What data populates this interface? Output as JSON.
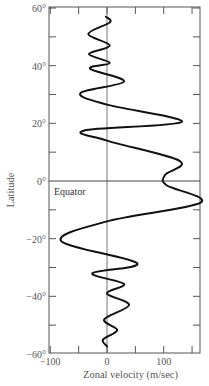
{
  "chart_data": {
    "type": "line",
    "title": "",
    "xlabel": "Zonal velocity (m/sec)",
    "ylabel": "Latitude",
    "xlim": [
      -100,
      165
    ],
    "ylim": [
      -60,
      60
    ],
    "x_ticks": [
      -100,
      -50,
      0,
      50,
      100,
      150
    ],
    "x_tick_labels": [
      "−100",
      "",
      "0",
      "",
      "100",
      ""
    ],
    "y_ticks": [
      60,
      50,
      40,
      30,
      20,
      10,
      0,
      -10,
      -20,
      -30,
      -40,
      -50,
      -60
    ],
    "y_tick_labels": [
      "60°",
      "",
      "40°",
      "",
      "20°",
      "",
      "0°",
      "",
      "−20°",
      "",
      "−40°",
      "",
      "−60°"
    ],
    "grid": false,
    "reference_lines": [
      {
        "orientation": "vertical",
        "value": 0
      },
      {
        "orientation": "horizontal",
        "value": 0,
        "label": "Equator"
      }
    ],
    "annotations": [
      {
        "text": "Equator",
        "x": -95,
        "y": -2
      }
    ],
    "series": [
      {
        "name": "zonal velocity profile",
        "points": [
          {
            "v": -2,
            "lat": 57
          },
          {
            "v": 5,
            "lat": 55
          },
          {
            "v": -33,
            "lat": 51
          },
          {
            "v": 5,
            "lat": 47
          },
          {
            "v": -32,
            "lat": 44
          },
          {
            "v": 5,
            "lat": 41
          },
          {
            "v": -30,
            "lat": 39
          },
          {
            "v": 30,
            "lat": 34.5
          },
          {
            "v": -47,
            "lat": 30.5
          },
          {
            "v": 0,
            "lat": 26.5
          },
          {
            "v": 132,
            "lat": 20.5
          },
          {
            "v": -40,
            "lat": 17.5
          },
          {
            "v": 0,
            "lat": 14
          },
          {
            "v": 128,
            "lat": 7
          },
          {
            "v": 102,
            "lat": 2
          },
          {
            "v": 105,
            "lat": -1.5
          },
          {
            "v": 165,
            "lat": -7.5
          },
          {
            "v": 0,
            "lat": -14
          },
          {
            "v": -81,
            "lat": -20.8
          },
          {
            "v": 53,
            "lat": -28.5
          },
          {
            "v": -26,
            "lat": -32
          },
          {
            "v": 30,
            "lat": -35.7
          },
          {
            "v": 0,
            "lat": -39
          },
          {
            "v": 39,
            "lat": -43
          },
          {
            "v": -5,
            "lat": -48
          },
          {
            "v": 18,
            "lat": -51.7
          },
          {
            "v": -7,
            "lat": -55
          },
          {
            "v": 0,
            "lat": -57.3
          }
        ]
      }
    ]
  }
}
